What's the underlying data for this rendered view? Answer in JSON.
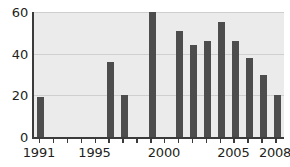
{
  "chart_data": {
    "type": "bar",
    "title": "",
    "subtitle": "",
    "xlabel": "",
    "ylabel": "",
    "categories": [
      "1991",
      "1992",
      "1993",
      "1994",
      "1995",
      "1996",
      "1997",
      "1998",
      "1999",
      "2000",
      "2001",
      "2002",
      "2003",
      "2004",
      "2005",
      "2006",
      "2007",
      "2008"
    ],
    "values": [
      19,
      0,
      0,
      0,
      0,
      36,
      20,
      0,
      60,
      0,
      51,
      44,
      46,
      55,
      46,
      38,
      30,
      20
    ],
    "ylim": [
      0,
      60
    ],
    "xlim": [
      1990.5,
      2008.5
    ],
    "yticks": [
      0,
      20,
      40,
      60
    ],
    "ytick_labels": [
      "0",
      "20",
      "40",
      "60"
    ],
    "xtick_values": [
      1991,
      1992,
      1993,
      1994,
      1995,
      1996,
      1997,
      1998,
      1999,
      2000,
      2001,
      2002,
      2003,
      2004,
      2005,
      2006,
      2007,
      2008
    ],
    "xtick_labels_shown": [
      {
        "value": 1991,
        "label": "1991"
      },
      {
        "value": 1995,
        "label": "1995"
      },
      {
        "value": 2000,
        "label": "2000"
      },
      {
        "value": 2005,
        "label": "2005"
      },
      {
        "value": 2008,
        "label": "2008"
      }
    ],
    "grid": true,
    "grid_axis": "y",
    "legend": null,
    "colors": {
      "bar": "#4d4d4d",
      "plot_background": "#ebebeb",
      "gridline": "#cfcfcf",
      "axis": "#3b3b3b",
      "text": "#231f20",
      "page_background": "#ffffff"
    }
  }
}
